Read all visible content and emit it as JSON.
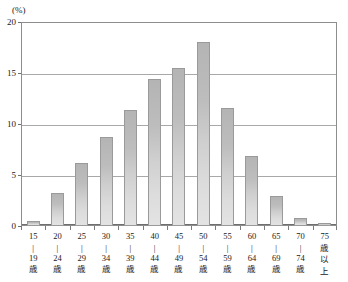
{
  "chart_data": {
    "type": "bar",
    "title": "",
    "xlabel": "",
    "ylabel": "(%)",
    "ylim": [
      0,
      20
    ],
    "yticks": [
      0,
      5,
      10,
      15,
      20
    ],
    "grid": true,
    "legend": "none",
    "categories": [
      "15〜19歳",
      "20〜24歳",
      "25〜29歳",
      "30〜34歳",
      "35〜39歳",
      "40〜44歳",
      "45〜49歳",
      "50〜54歳",
      "55〜59歳",
      "60〜64歳",
      "65〜69歳",
      "70〜74歳",
      "75歳以上"
    ],
    "values": [
      0.5,
      3.2,
      6.2,
      8.7,
      11.4,
      14.4,
      15.5,
      18.0,
      11.6,
      6.9,
      2.9,
      0.8,
      0.25
    ],
    "bar_color": "#c8c8c8",
    "bar_border_color": "#9a9a9a",
    "grid_color": "#a8a8a8",
    "axis_color": "#6f6f6f"
  },
  "axis": {
    "unit_label": "(%)",
    "ytick_labels": [
      "0",
      "5",
      "10",
      "15",
      "20"
    ]
  },
  "xcategory_labels": [
    {
      "from": "15",
      "sep": "〜",
      "to": "19",
      "suffix": "歳"
    },
    {
      "from": "20",
      "sep": "〜",
      "to": "24",
      "suffix": "歳"
    },
    {
      "from": "25",
      "sep": "〜",
      "to": "29",
      "suffix": "歳"
    },
    {
      "from": "30",
      "sep": "〜",
      "to": "34",
      "suffix": "歳"
    },
    {
      "from": "35",
      "sep": "〜",
      "to": "39",
      "suffix": "歳"
    },
    {
      "from": "40",
      "sep": "〜",
      "to": "44",
      "suffix": "歳"
    },
    {
      "from": "45",
      "sep": "〜",
      "to": "49",
      "suffix": "歳"
    },
    {
      "from": "50",
      "sep": "〜",
      "to": "54",
      "suffix": "歳"
    },
    {
      "from": "55",
      "sep": "〜",
      "to": "59",
      "suffix": "歳"
    },
    {
      "from": "60",
      "sep": "〜",
      "to": "64",
      "suffix": "歳"
    },
    {
      "from": "65",
      "sep": "〜",
      "to": "69",
      "suffix": "歳"
    },
    {
      "from": "70",
      "sep": "〜",
      "to": "74",
      "suffix": "歳"
    },
    {
      "from": "75",
      "sep": "歳",
      "to": "以",
      "suffix": "上"
    }
  ]
}
